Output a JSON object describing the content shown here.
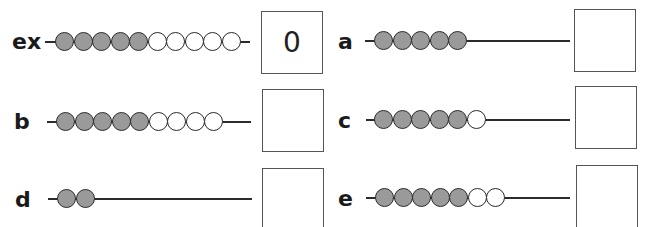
{
  "items": [
    {
      "label": "ex",
      "filled": 5,
      "empty": 5,
      "answer": "0",
      "wire_end": "short"
    },
    {
      "label": "a",
      "filled": 5,
      "empty": 0,
      "answer": "",
      "wire_end": "long"
    },
    {
      "label": "b",
      "filled": 5,
      "empty": 4,
      "answer": "",
      "wire_end": "short"
    },
    {
      "label": "c",
      "filled": 5,
      "empty": 1,
      "answer": "",
      "wire_end": "long"
    },
    {
      "label": "d",
      "filled": 2,
      "empty": 0,
      "answer": "",
      "wire_end": "long"
    },
    {
      "label": "e",
      "filled": 5,
      "empty": 2,
      "answer": "",
      "wire_end": "long"
    }
  ],
  "colors": {
    "filled_bead": "#9a9a9a",
    "empty_bead": "#ffffff",
    "outline": "#2a2a2a"
  }
}
